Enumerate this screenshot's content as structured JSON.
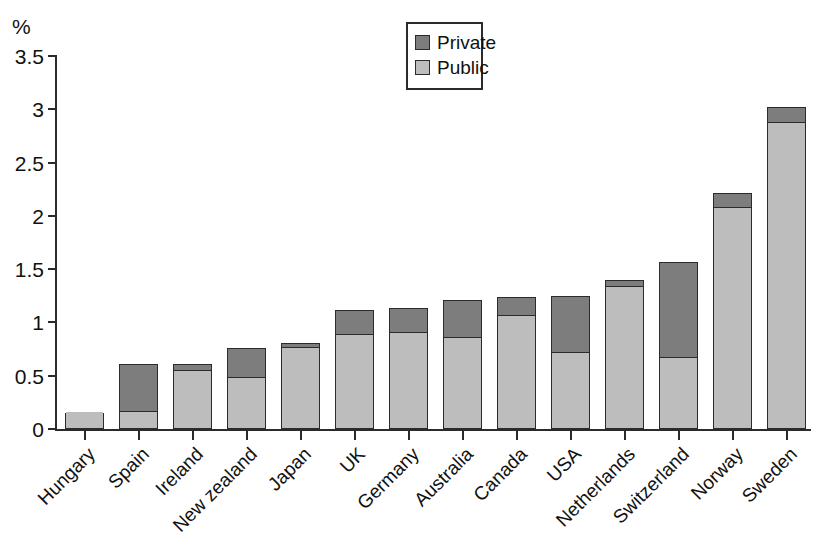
{
  "chart_data": {
    "type": "bar",
    "stacked": true,
    "title": "",
    "subtitle": "",
    "xlabel": "",
    "ylabel": "",
    "y_unit_label": "%",
    "ylim": [
      0,
      3.5
    ],
    "ytick_step": 0.5,
    "ytick_labels": [
      "3.5",
      "3",
      "2.5",
      "2",
      "1.5",
      "1",
      "0.5",
      "0"
    ],
    "ytick_values": [
      3.5,
      3,
      2.5,
      2,
      1.5,
      1,
      0.5,
      0
    ],
    "grid": false,
    "legend_position": "top-right",
    "categories": [
      "Hungary",
      "Spain",
      "Ireland",
      "New zealand",
      "Japan",
      "UK",
      "Germany",
      "Australia",
      "Canada",
      "USA",
      "Netherlands",
      "Switzerland",
      "Norway",
      "Sweden"
    ],
    "series": [
      {
        "name": "Public",
        "color": "#bdbdbd",
        "values": [
          0.15,
          0.17,
          0.55,
          0.49,
          0.77,
          0.89,
          0.91,
          0.86,
          1.07,
          0.72,
          1.34,
          0.68,
          2.08,
          2.88
        ]
      },
      {
        "name": "Private",
        "color": "#7d7d7d",
        "values": [
          0.0,
          0.44,
          0.06,
          0.27,
          0.04,
          0.23,
          0.23,
          0.35,
          0.17,
          0.53,
          0.06,
          0.89,
          0.13,
          0.14
        ]
      }
    ],
    "totals": [
      0.15,
      0.61,
      0.61,
      0.76,
      0.81,
      1.12,
      1.14,
      1.21,
      1.24,
      1.25,
      1.4,
      1.57,
      2.21,
      3.02
    ]
  },
  "legend": {
    "items": [
      {
        "label": "Private",
        "color": "#7d7d7d"
      },
      {
        "label": "Public",
        "color": "#bdbdbd"
      }
    ]
  },
  "axis": {
    "unit": "%"
  }
}
